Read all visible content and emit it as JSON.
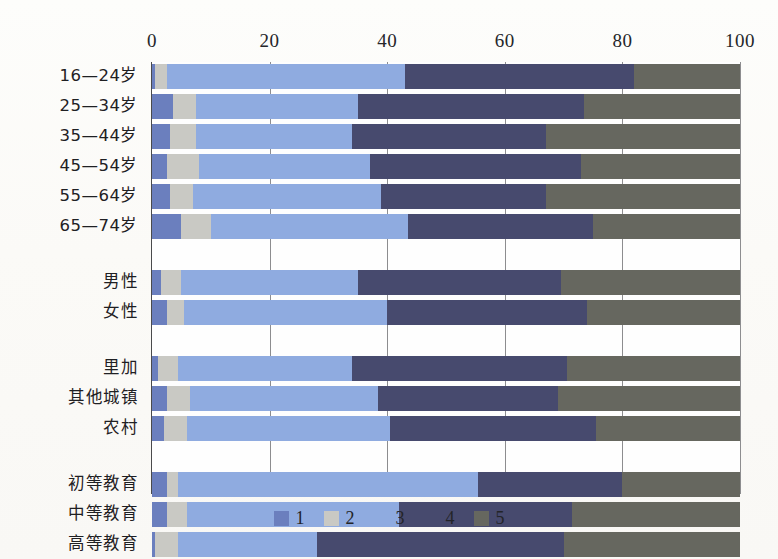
{
  "chart_data": {
    "type": "bar",
    "orientation": "horizontal",
    "stacked": true,
    "title": "",
    "xlabel": "",
    "ylabel": "",
    "xlim": [
      0,
      100
    ],
    "xticks": [
      0,
      20,
      40,
      60,
      80,
      100
    ],
    "grid": true,
    "legend_position": "bottom",
    "series": [
      {
        "name": "1",
        "color": "#6b7fbe"
      },
      {
        "name": "2",
        "color": "#c9c9c4"
      },
      {
        "name": "3",
        "color": "#8fabe0"
      },
      {
        "name": "4",
        "color": "#474a6e"
      },
      {
        "name": "5",
        "color": "#66675f"
      }
    ],
    "groups": [
      {
        "name": "age",
        "categories": [
          "16—24岁",
          "25—34岁",
          "35—44岁",
          "45—54岁",
          "55—64岁",
          "65—74岁"
        ],
        "values": [
          [
            0.5,
            2.0,
            40.5,
            39.0,
            18.0
          ],
          [
            3.5,
            4.0,
            27.5,
            38.5,
            26.5
          ],
          [
            3.0,
            4.5,
            26.5,
            33.0,
            33.0
          ],
          [
            2.5,
            5.5,
            29.0,
            36.0,
            27.0
          ],
          [
            3.0,
            4.0,
            32.0,
            28.0,
            33.0
          ],
          [
            5.0,
            5.0,
            33.5,
            31.5,
            25.0
          ]
        ]
      },
      {
        "name": "gender",
        "categories": [
          "男性",
          "女性"
        ],
        "values": [
          [
            1.5,
            3.5,
            30.0,
            34.5,
            30.5
          ],
          [
            2.5,
            3.0,
            34.5,
            34.0,
            26.0
          ]
        ]
      },
      {
        "name": "region",
        "categories": [
          "里加",
          "其他城镇",
          "农村"
        ],
        "values": [
          [
            1.0,
            3.5,
            29.5,
            36.5,
            29.5
          ],
          [
            2.5,
            4.0,
            32.0,
            30.5,
            31.0
          ],
          [
            2.0,
            4.0,
            34.5,
            35.0,
            24.5
          ]
        ]
      },
      {
        "name": "education",
        "categories": [
          "初等教育",
          "中等教育",
          "高等教育"
        ],
        "values": [
          [
            2.5,
            2.0,
            51.0,
            24.5,
            20.0
          ],
          [
            2.5,
            3.5,
            36.0,
            29.5,
            28.5
          ],
          [
            0.5,
            4.0,
            23.5,
            42.0,
            30.0
          ]
        ]
      }
    ]
  },
  "legend": {
    "items": [
      {
        "label": "1",
        "color": "#6b7fbe"
      },
      {
        "label": "2",
        "color": "#c9c9c4"
      },
      {
        "label": "3",
        "color": "#8fabe0"
      },
      {
        "label": "4",
        "color": "#474a6e"
      },
      {
        "label": "5",
        "color": "#66675f"
      }
    ]
  }
}
